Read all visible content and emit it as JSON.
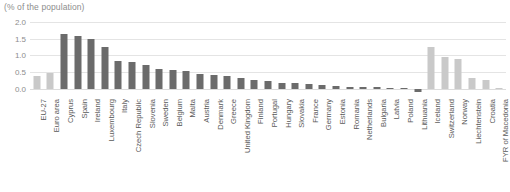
{
  "chart_data": {
    "type": "bar",
    "title": "(% of the population)",
    "xlabel": "",
    "ylabel": "",
    "ylim": [
      -0.25,
      2.0
    ],
    "yticks": [
      0.0,
      0.5,
      1.0,
      1.5,
      2.0
    ],
    "ytick_labels": [
      "0.0",
      "0.5",
      "1.0",
      "1.5",
      "2.0"
    ],
    "grid": true,
    "legend": "none",
    "colors": {
      "aggregate_bar": "#c9c9c9",
      "member_bar": "#6b6b6b",
      "non_member_bar": "#c9c9c9",
      "gridline": "#e4e4e4",
      "text": "#595959",
      "title_text": "#8d8d8d"
    },
    "categories": [
      "EU-27",
      "Euro area",
      "Cyprus",
      "Spain",
      "Ireland",
      "Luxembourg",
      "Italy",
      "Czech Republic",
      "Slovenia",
      "Sweden",
      "Belgium",
      "Malta",
      "Austria",
      "Denmark",
      "Greece",
      "United Kingdom",
      "Finland",
      "Portugal",
      "Hungary",
      "Slovakia",
      "France",
      "Germany",
      "Estonia",
      "Romania",
      "Netherlands",
      "Bulgaria",
      "Latvia",
      "Poland",
      "Lithuania",
      "Iceland",
      "Switzerland",
      "Norway",
      "Liechtenstein",
      "Croatia",
      "FYR of Macedonia"
    ],
    "values": [
      0.38,
      0.48,
      1.65,
      1.58,
      1.48,
      1.25,
      0.83,
      0.8,
      0.7,
      0.58,
      0.55,
      0.53,
      0.45,
      0.42,
      0.38,
      0.33,
      0.26,
      0.23,
      0.18,
      0.16,
      0.15,
      0.1,
      0.08,
      0.06,
      0.05,
      0.04,
      0.03,
      0.02,
      -0.1,
      1.25,
      0.95,
      0.9,
      0.33,
      0.25,
      0.02
    ],
    "series_styles": [
      "light",
      "light",
      "dark",
      "dark",
      "dark",
      "dark",
      "dark",
      "dark",
      "dark",
      "dark",
      "dark",
      "dark",
      "dark",
      "dark",
      "dark",
      "dark",
      "dark",
      "dark",
      "dark",
      "dark",
      "dark",
      "dark",
      "dark",
      "dark",
      "dark",
      "dark",
      "dark",
      "dark",
      "dark",
      "light",
      "light",
      "light",
      "light",
      "light",
      "light"
    ]
  }
}
